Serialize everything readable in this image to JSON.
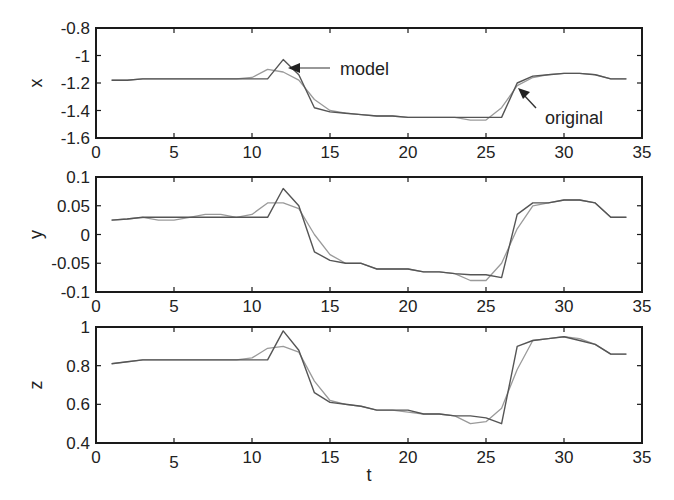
{
  "chart_data": [
    {
      "type": "line",
      "ylabel": "x",
      "xlabel": "",
      "xlim": [
        0,
        35
      ],
      "ylim": [
        -1.6,
        -0.8
      ],
      "xticks": [
        "0",
        "5",
        "10",
        "15",
        "20",
        "25",
        "30",
        "35"
      ],
      "yticks": [
        "-0.8",
        "-1",
        "-1.2",
        "-1.4",
        "-1.6"
      ],
      "ytick_values": [
        -0.8,
        -1.0,
        -1.2,
        -1.4,
        -1.6
      ],
      "annotations": [
        {
          "text": "model",
          "target": [
            12.6,
            -1.09
          ]
        },
        {
          "text": "original",
          "target": [
            27.2,
            -1.24
          ]
        }
      ],
      "series": [
        {
          "name": "original",
          "x": [
            1,
            2,
            3,
            4,
            5,
            6,
            7,
            8,
            9,
            10,
            11,
            12,
            13,
            14,
            15,
            16,
            17,
            18,
            19,
            20,
            21,
            22,
            23,
            24,
            25,
            26,
            27,
            28,
            29,
            30,
            31,
            32,
            33,
            34
          ],
          "values": [
            -1.18,
            -1.18,
            -1.17,
            -1.17,
            -1.17,
            -1.17,
            -1.17,
            -1.17,
            -1.17,
            -1.17,
            -1.17,
            -1.03,
            -1.14,
            -1.38,
            -1.41,
            -1.42,
            -1.43,
            -1.44,
            -1.44,
            -1.45,
            -1.45,
            -1.45,
            -1.45,
            -1.45,
            -1.45,
            -1.45,
            -1.2,
            -1.15,
            -1.14,
            -1.13,
            -1.13,
            -1.14,
            -1.17,
            -1.17
          ]
        },
        {
          "name": "model",
          "x": [
            1,
            2,
            3,
            4,
            5,
            6,
            7,
            8,
            9,
            10,
            11,
            12,
            13,
            14,
            15,
            16,
            17,
            18,
            19,
            20,
            21,
            22,
            23,
            24,
            25,
            26,
            27,
            28,
            29,
            30,
            31,
            32,
            33,
            34
          ],
          "values": [
            -1.18,
            -1.18,
            -1.17,
            -1.17,
            -1.17,
            -1.17,
            -1.17,
            -1.17,
            -1.17,
            -1.16,
            -1.1,
            -1.12,
            -1.18,
            -1.32,
            -1.4,
            -1.42,
            -1.43,
            -1.44,
            -1.44,
            -1.45,
            -1.45,
            -1.45,
            -1.45,
            -1.47,
            -1.47,
            -1.38,
            -1.22,
            -1.16,
            -1.14,
            -1.13,
            -1.13,
            -1.14,
            -1.17,
            -1.17
          ]
        }
      ]
    },
    {
      "type": "line",
      "ylabel": "y",
      "xlabel": "",
      "xlim": [
        0,
        35
      ],
      "ylim": [
        -0.1,
        0.1
      ],
      "xticks": [
        "0",
        "5",
        "10",
        "15",
        "20",
        "25",
        "30",
        "35"
      ],
      "yticks": [
        "0.1",
        "0.05",
        "0",
        "-0.05",
        "-0.1"
      ],
      "ytick_values": [
        0.1,
        0.05,
        0,
        -0.05,
        -0.1
      ],
      "series": [
        {
          "name": "original",
          "x": [
            1,
            2,
            3,
            4,
            5,
            6,
            7,
            8,
            9,
            10,
            11,
            12,
            13,
            14,
            15,
            16,
            17,
            18,
            19,
            20,
            21,
            22,
            23,
            24,
            25,
            26,
            27,
            28,
            29,
            30,
            31,
            32,
            33,
            34
          ],
          "values": [
            0.025,
            0.027,
            0.03,
            0.03,
            0.03,
            0.03,
            0.03,
            0.03,
            0.03,
            0.03,
            0.03,
            0.08,
            0.05,
            -0.03,
            -0.045,
            -0.05,
            -0.05,
            -0.06,
            -0.06,
            -0.06,
            -0.065,
            -0.065,
            -0.068,
            -0.07,
            -0.07,
            -0.075,
            0.035,
            0.055,
            0.055,
            0.06,
            0.06,
            0.055,
            0.03,
            0.03
          ]
        },
        {
          "name": "model",
          "x": [
            1,
            2,
            3,
            4,
            5,
            6,
            7,
            8,
            9,
            10,
            11,
            12,
            13,
            14,
            15,
            16,
            17,
            18,
            19,
            20,
            21,
            22,
            23,
            24,
            25,
            26,
            27,
            28,
            29,
            30,
            31,
            32,
            33,
            34
          ],
          "values": [
            0.025,
            0.027,
            0.03,
            0.025,
            0.025,
            0.03,
            0.035,
            0.035,
            0.03,
            0.035,
            0.055,
            0.055,
            0.045,
            0.0,
            -0.035,
            -0.05,
            -0.05,
            -0.06,
            -0.06,
            -0.06,
            -0.065,
            -0.065,
            -0.068,
            -0.08,
            -0.08,
            -0.05,
            0.01,
            0.05,
            0.055,
            0.06,
            0.06,
            0.055,
            0.03,
            0.03
          ]
        }
      ]
    },
    {
      "type": "line",
      "ylabel": "z",
      "xlabel": "t",
      "xlim": [
        0,
        35
      ],
      "ylim": [
        0.4,
        1.0
      ],
      "xticks": [
        "0",
        "5",
        "10",
        "15",
        "20",
        "25",
        "30",
        "35"
      ],
      "yticks": [
        "1",
        "0.8",
        "0.6",
        "0.4"
      ],
      "ytick_values": [
        1.0,
        0.8,
        0.6,
        0.4
      ],
      "series": [
        {
          "name": "original",
          "x": [
            1,
            2,
            3,
            4,
            5,
            6,
            7,
            8,
            9,
            10,
            11,
            12,
            13,
            14,
            15,
            16,
            17,
            18,
            19,
            20,
            21,
            22,
            23,
            24,
            25,
            26,
            27,
            28,
            29,
            30,
            31,
            32,
            33,
            34
          ],
          "values": [
            0.81,
            0.82,
            0.83,
            0.83,
            0.83,
            0.83,
            0.83,
            0.83,
            0.83,
            0.83,
            0.83,
            0.98,
            0.88,
            0.66,
            0.61,
            0.6,
            0.59,
            0.57,
            0.57,
            0.57,
            0.55,
            0.55,
            0.54,
            0.54,
            0.53,
            0.5,
            0.9,
            0.93,
            0.94,
            0.95,
            0.93,
            0.91,
            0.86,
            0.86
          ]
        },
        {
          "name": "model",
          "x": [
            1,
            2,
            3,
            4,
            5,
            6,
            7,
            8,
            9,
            10,
            11,
            12,
            13,
            14,
            15,
            16,
            17,
            18,
            19,
            20,
            21,
            22,
            23,
            24,
            25,
            26,
            27,
            28,
            29,
            30,
            31,
            32,
            33,
            34
          ],
          "values": [
            0.81,
            0.82,
            0.83,
            0.83,
            0.83,
            0.83,
            0.83,
            0.83,
            0.83,
            0.84,
            0.89,
            0.9,
            0.87,
            0.72,
            0.62,
            0.6,
            0.59,
            0.57,
            0.57,
            0.56,
            0.55,
            0.55,
            0.54,
            0.5,
            0.51,
            0.58,
            0.78,
            0.93,
            0.94,
            0.95,
            0.94,
            0.91,
            0.86,
            0.86
          ]
        }
      ]
    }
  ],
  "labels": {
    "model_annotation": "model",
    "original_annotation": "original",
    "x_axis_label": "t"
  },
  "colors": {
    "axes": "#1a1a1a",
    "original_line": "#555555",
    "model_line": "#9a9a9a",
    "text": "#222222"
  }
}
